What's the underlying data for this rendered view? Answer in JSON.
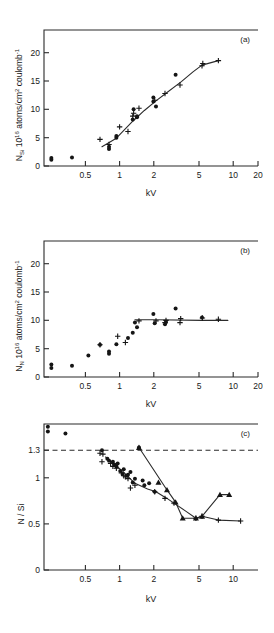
{
  "figure": {
    "panels": [
      "a",
      "b",
      "c"
    ],
    "xlabel": "kV"
  },
  "panel_a": {
    "label": "(a)",
    "ylabel_main": "N",
    "ylabel_sub": "Si",
    "ylabel_rest": "10",
    "ylabel_exp": "16",
    "ylabel_units": " atoms/cm",
    "ylabel_units_exp": "2",
    "ylabel_units_tail": " coulomb",
    "ylabel_units_tail_exp": "-1",
    "xlabel": "kV",
    "yticks": [
      "0",
      "5",
      "10",
      "15",
      "20"
    ],
    "xticks": [
      "0.5",
      "1",
      "2",
      "5",
      "10",
      "20"
    ]
  },
  "panel_b": {
    "label": "(b)",
    "ylabel_main": "N",
    "ylabel_sub": "N",
    "ylabel_rest": "10",
    "ylabel_exp": "16",
    "ylabel_units": " atoms/cm",
    "ylabel_units_exp": "2",
    "ylabel_units_tail": " coulomb",
    "ylabel_units_tail_exp": "-1",
    "xlabel": "kV",
    "yticks": [
      "0",
      "5",
      "10",
      "15",
      "20"
    ],
    "xticks": [
      "0.5",
      "1",
      "2",
      "5",
      "10",
      "20"
    ]
  },
  "panel_c": {
    "label": "(c)",
    "ylabel": "N / Si",
    "xlabel": "kV",
    "yticks": [
      "0",
      "0.5",
      "1",
      "1.3"
    ],
    "xticks": [
      "0.5",
      "1",
      "2",
      "5",
      "10"
    ],
    "reference_line_value": 1.3
  },
  "chart_data": [
    {
      "type": "scatter",
      "panel": "a",
      "title": "(a)",
      "xlabel": "kV",
      "ylabel": "N_Si  10^16 atoms/cm^2 coulomb^-1",
      "xscale": "log",
      "xlim": [
        0.1,
        20
      ],
      "ylim": [
        0,
        24
      ],
      "xticks": [
        0.5,
        1,
        2,
        5,
        10,
        20
      ],
      "yticks": [
        0,
        5,
        10,
        15,
        20
      ],
      "grid": false,
      "legend": "none",
      "series": [
        {
          "name": "dots",
          "marker": "filled-circle",
          "points": [
            [
              0.12,
              1.1
            ],
            [
              0.12,
              1.4
            ],
            [
              0.2,
              1.5
            ],
            [
              0.5,
              3.0
            ],
            [
              0.5,
              3.4
            ],
            [
              0.6,
              5.0
            ],
            [
              0.6,
              5.3
            ],
            [
              0.9,
              8.2
            ],
            [
              0.92,
              10.0
            ],
            [
              1.0,
              8.6
            ],
            [
              1.0,
              8.8
            ],
            [
              1.5,
              11.4
            ],
            [
              1.5,
              12.1
            ],
            [
              1.6,
              10.5
            ],
            [
              2.6,
              16.1
            ]
          ]
        },
        {
          "name": "plus",
          "marker": "plus",
          "points": [
            [
              0.4,
              4.7
            ],
            [
              0.5,
              3.8
            ],
            [
              0.65,
              6.9
            ],
            [
              0.8,
              6.1
            ],
            [
              0.9,
              8.8
            ],
            [
              0.92,
              9.3
            ],
            [
              1.05,
              10.2
            ],
            [
              1.55,
              11.6
            ],
            [
              2.0,
              12.8
            ],
            [
              2.9,
              14.3
            ],
            [
              5.0,
              17.7
            ],
            [
              5.1,
              18.1
            ],
            [
              7.5,
              18.6
            ]
          ]
        }
      ],
      "fit_curve": {
        "name": "trend-line",
        "points": [
          [
            0.42,
            3.4
          ],
          [
            0.6,
            4.9
          ],
          [
            0.9,
            7.9
          ],
          [
            1.2,
            9.8
          ],
          [
            1.6,
            11.5
          ],
          [
            2.0,
            12.7
          ],
          [
            3.0,
            14.9
          ],
          [
            4.0,
            16.6
          ],
          [
            5.0,
            17.8
          ],
          [
            7.5,
            18.6
          ]
        ]
      }
    },
    {
      "type": "scatter",
      "panel": "b",
      "title": "(b)",
      "xlabel": "kV",
      "ylabel": "N_N  10^16 atoms/cm^2 coulomb^-1",
      "xscale": "log",
      "xlim": [
        0.1,
        20
      ],
      "ylim": [
        0,
        24
      ],
      "xticks": [
        0.5,
        1,
        2,
        5,
        10,
        20
      ],
      "yticks": [
        0,
        5,
        10,
        15,
        20
      ],
      "grid": false,
      "legend": "none",
      "series": [
        {
          "name": "dots",
          "marker": "filled-circle",
          "points": [
            [
              0.12,
              2.2
            ],
            [
              0.12,
              1.6
            ],
            [
              0.2,
              2.0
            ],
            [
              0.3,
              3.8
            ],
            [
              0.4,
              5.7
            ],
            [
              0.5,
              4.1
            ],
            [
              0.5,
              4.5
            ],
            [
              0.6,
              5.8
            ],
            [
              0.8,
              6.9
            ],
            [
              0.9,
              7.8
            ],
            [
              0.95,
              9.6
            ],
            [
              1.0,
              8.8
            ],
            [
              1.5,
              11.1
            ],
            [
              1.55,
              9.5
            ],
            [
              2.0,
              9.3
            ],
            [
              2.05,
              9.7
            ],
            [
              2.6,
              12.1
            ],
            [
              5.0,
              10.5
            ]
          ]
        },
        {
          "name": "plus",
          "marker": "plus",
          "points": [
            [
              0.4,
              5.7
            ],
            [
              0.62,
              7.2
            ],
            [
              0.75,
              6.1
            ],
            [
              1.05,
              9.9
            ],
            [
              1.6,
              9.9
            ],
            [
              2.0,
              9.6
            ],
            [
              2.05,
              10.0
            ],
            [
              2.9,
              9.6
            ],
            [
              2.95,
              10.3
            ],
            [
              5.05,
              10.4
            ],
            [
              7.5,
              10.2
            ]
          ]
        }
      ],
      "fit_curve": {
        "name": "plateau-line",
        "points": [
          [
            0.95,
            10.1
          ],
          [
            1.6,
            10.1
          ],
          [
            5.0,
            10.0
          ],
          [
            9.5,
            10.0
          ]
        ]
      }
    },
    {
      "type": "scatter",
      "panel": "c",
      "title": "(c)",
      "xlabel": "kV",
      "ylabel": "N / Si",
      "xscale": "log",
      "xlim": [
        0.1,
        20
      ],
      "ylim": [
        0,
        1.55
      ],
      "xticks": [
        0.5,
        1,
        2,
        5,
        10
      ],
      "yticks": [
        0,
        0.5,
        1,
        1.3
      ],
      "grid": false,
      "legend": "none",
      "reference_line": {
        "y": 1.3,
        "style": "dashed"
      },
      "series": [
        {
          "name": "dots",
          "marker": "filled-circle",
          "points": [
            [
              0.11,
              1.47
            ],
            [
              0.11,
              1.52
            ],
            [
              0.17,
              1.45
            ],
            [
              0.42,
              1.27
            ],
            [
              0.48,
              1.18
            ],
            [
              0.5,
              1.16
            ],
            [
              0.55,
              1.15
            ],
            [
              0.57,
              1.12
            ],
            [
              0.6,
              1.1
            ],
            [
              0.62,
              1.13
            ],
            [
              0.66,
              1.05
            ],
            [
              0.7,
              1.02
            ],
            [
              0.72,
              1.07
            ],
            [
              0.78,
              1.0
            ],
            [
              0.8,
              1.01
            ],
            [
              0.85,
              1.04
            ],
            [
              0.9,
              0.93
            ],
            [
              0.95,
              0.97
            ],
            [
              1.15,
              0.95
            ],
            [
              1.2,
              0.9
            ],
            [
              1.35,
              0.92
            ],
            [
              1.55,
              0.83
            ],
            [
              1.05,
              1.3
            ]
          ]
        },
        {
          "name": "plus",
          "marker": "plus",
          "points": [
            [
              0.4,
              1.24
            ],
            [
              0.43,
              1.23
            ],
            [
              0.42,
              1.15
            ],
            [
              0.52,
              1.13
            ],
            [
              0.55,
              1.1
            ],
            [
              0.6,
              1.08
            ],
            [
              0.68,
              1.03
            ],
            [
              0.72,
              1.0
            ],
            [
              0.75,
              0.99
            ],
            [
              0.8,
              0.97
            ],
            [
              0.85,
              0.87
            ],
            [
              0.95,
              0.9
            ],
            [
              1.55,
              0.83
            ],
            [
              2.0,
              0.76
            ],
            [
              2.5,
              0.71
            ],
            [
              4.3,
              0.55
            ],
            [
              5.0,
              0.57
            ],
            [
              7.5,
              0.53
            ],
            [
              13.0,
              0.52
            ]
          ]
        },
        {
          "name": "triangles",
          "marker": "filled-triangle",
          "points": [
            [
              1.05,
              1.3
            ],
            [
              1.7,
              0.93
            ],
            [
              2.1,
              0.85
            ],
            [
              2.6,
              0.72
            ],
            [
              3.1,
              0.55
            ],
            [
              4.3,
              0.55
            ],
            [
              5.0,
              0.57
            ],
            [
              7.8,
              0.8
            ],
            [
              9.8,
              0.8
            ]
          ]
        }
      ],
      "fit_curves": [
        {
          "name": "dot-trend-line",
          "points": [
            [
              0.46,
              1.2
            ],
            [
              0.7,
              1.05
            ],
            [
              0.95,
              0.92
            ],
            [
              1.3,
              0.86
            ],
            [
              1.6,
              0.83
            ],
            [
              2.1,
              0.76
            ],
            [
              2.5,
              0.71
            ],
            [
              3.4,
              0.62
            ],
            [
              4.3,
              0.55
            ],
            [
              5.0,
              0.57
            ],
            [
              7.5,
              0.53
            ],
            [
              13.0,
              0.52
            ]
          ]
        },
        {
          "name": "triangle-trend-line",
          "points": [
            [
              1.05,
              1.3
            ],
            [
              2.1,
              0.85
            ],
            [
              2.6,
              0.72
            ],
            [
              3.1,
              0.55
            ],
            [
              4.3,
              0.55
            ],
            [
              5.0,
              0.57
            ],
            [
              7.8,
              0.8
            ],
            [
              9.8,
              0.8
            ]
          ]
        }
      ]
    }
  ]
}
